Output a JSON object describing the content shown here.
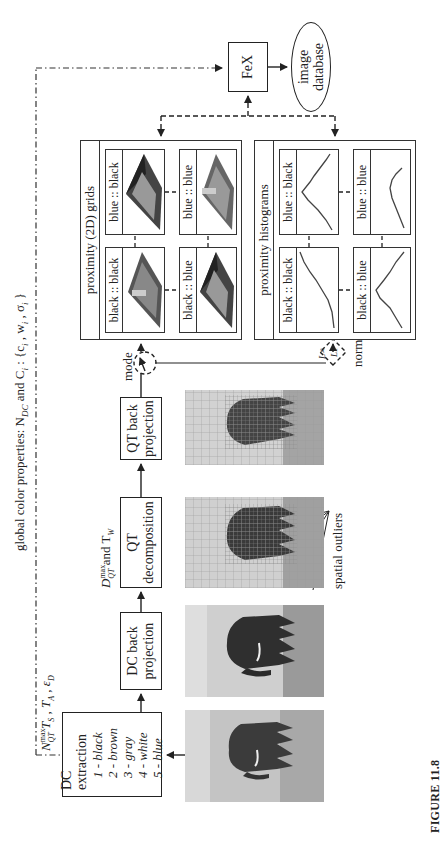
{
  "figure": {
    "caption": "FIGURE 11.8",
    "orientation": "rotated 90° counter-clockwise"
  },
  "global_properties": {
    "label": "global color properties: N",
    "sub_dc": "DC",
    "label_and": " and C",
    "sub_i": "i",
    "label_tail": " : {c",
    "sub_i2": "i",
    "sep1": " , w",
    "sub_i3": "i",
    "sep2": " , σ",
    "sub_i4": "i",
    "close": " }"
  },
  "parameters": {
    "dc_params": {
      "n": "N",
      "n_sup": "max",
      "n_sub": "QT",
      "rest": " T",
      "ts_sub": "S",
      "comma1": " , T",
      "ta_sub": "A",
      "comma2": " , ε",
      "ed_sub": "D"
    },
    "qt_params": {
      "d": "D",
      "d_sup": "max",
      "d_sub": "QT",
      "and": " and T",
      "tw_sub": "W"
    }
  },
  "blocks": {
    "dc_extraction": {
      "title": "DC extraction",
      "items": [
        "1 - black",
        "2 - brown",
        "3 - gray",
        "4 - white",
        "5 - blue"
      ]
    },
    "dc_back_projection": {
      "line1": "DC back",
      "line2": "projection"
    },
    "qt_decomposition": {
      "line1": "QT",
      "line2": "decomposition"
    },
    "qt_back_projection": {
      "line1": "QT back",
      "line2": "projection"
    },
    "fex": {
      "label": "FeX"
    },
    "image_database": {
      "line1": "image",
      "line2": "database"
    }
  },
  "switches": {
    "mode": {
      "label": "mode"
    },
    "norm": {
      "label": "norm",
      "option1": "L∞",
      "option2": "L1"
    }
  },
  "panels": {
    "grids": {
      "title": "proximity (2D) grids",
      "cells": [
        "black :: black",
        "blue :: black",
        "black :: blue",
        "blue :: blue"
      ]
    },
    "histograms": {
      "title": "proximity histograms",
      "cells": [
        "black :: black",
        "blue :: black",
        "black :: blue",
        "blue :: blue"
      ]
    }
  },
  "annotations": {
    "spatial_outliers": "spatial outliers"
  },
  "images": {
    "original": "elephant photo (original)",
    "dc_back": "elephant DC back-projected",
    "qt_decomp": "elephant QT decomposition grid",
    "qt_back": "elephant QT back-projected"
  },
  "colors": {
    "line": "#222222",
    "sky": "#c9c9c9",
    "ground": "#8a8a8a",
    "elephant": "#3a3a3a"
  }
}
